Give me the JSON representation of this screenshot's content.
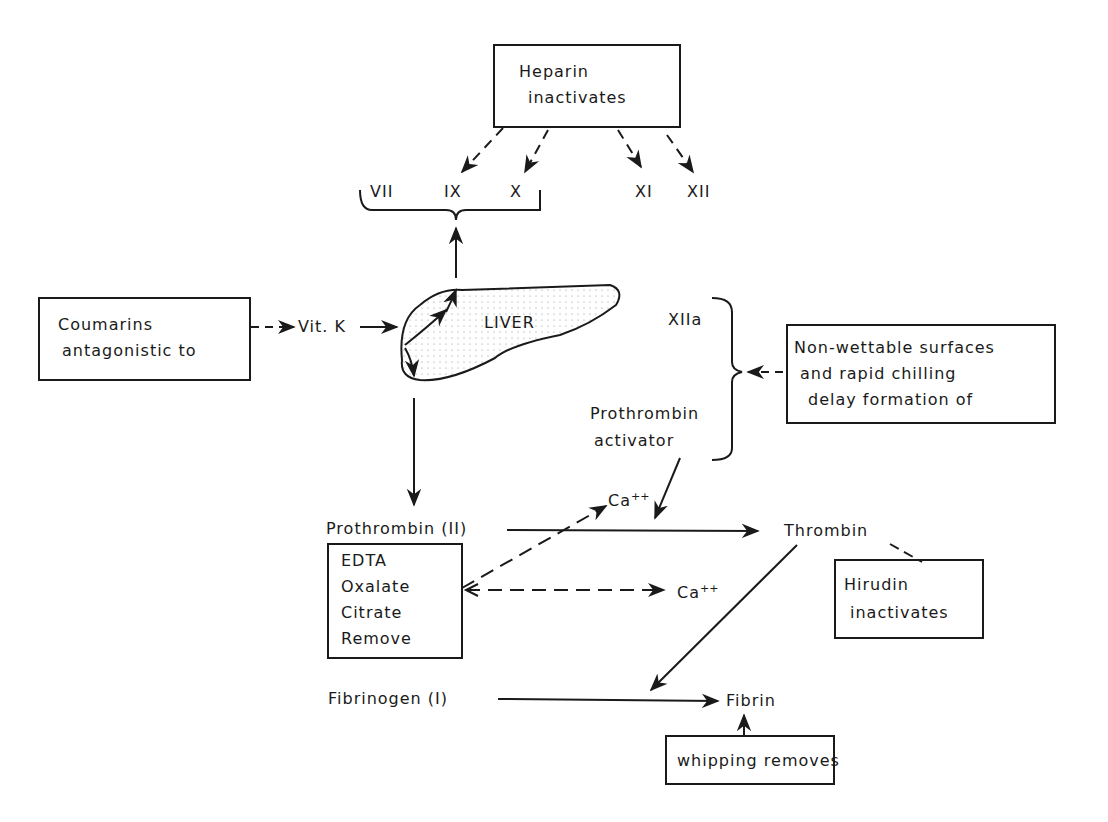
{
  "diagram": {
    "heparin_box": {
      "line1": "Heparin",
      "line2": "inactivates"
    },
    "factors_top": {
      "vii": "VII",
      "ix": "IX",
      "x": "X",
      "xi": "XI",
      "xii": "XII"
    },
    "coumarins_box": {
      "line1": "Coumarins",
      "line2": "antagonistic to"
    },
    "vit_k": "Vit. K",
    "liver": "LIVER",
    "xiia": "XIIa",
    "prothrombin_activator": {
      "line1": "Prothrombin",
      "line2": "activator"
    },
    "nonwettable_box": {
      "line1": "Non-wettable surfaces",
      "line2": "and rapid chilling",
      "line3": "delay formation of"
    },
    "ca_upper": {
      "base": "Ca",
      "sup": "++"
    },
    "ca_lower": {
      "base": "Ca",
      "sup": "++"
    },
    "prothrombin": "Prothrombin (II)",
    "thrombin": "Thrombin",
    "edta_box": {
      "line1": "EDTA",
      "line2": "Oxalate",
      "line3": "Citrate",
      "line4": "Remove"
    },
    "hirudin_box": {
      "line1": "Hirudin",
      "line2": "inactivates"
    },
    "fibrinogen": "Fibrinogen (I)",
    "fibrin": "Fibrin",
    "whipping_box": {
      "line1": "whipping removes"
    }
  },
  "colors": {
    "ink": "#1a1a1a",
    "background": "#ffffff",
    "liver_fill": "#eeeeee"
  }
}
